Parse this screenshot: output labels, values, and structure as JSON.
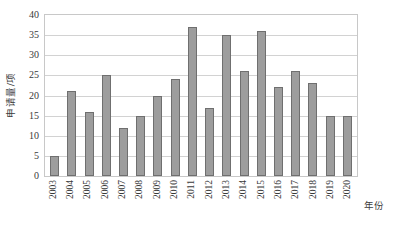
{
  "chart_data": {
    "type": "bar",
    "title": "",
    "subtitle": "",
    "xlabel": "年份",
    "ylabel": "申请量/项",
    "categories": [
      "2003",
      "2004",
      "2005",
      "2006",
      "2007",
      "2008",
      "2009",
      "2010",
      "2011",
      "2012",
      "2013",
      "2014",
      "2015",
      "2016",
      "2017",
      "2018",
      "2019",
      "2020"
    ],
    "values": [
      5,
      21,
      16,
      25,
      12,
      15,
      20,
      24,
      37,
      17,
      35,
      26,
      36,
      22,
      26,
      23,
      15,
      15
    ],
    "series": [
      {
        "name": "申请量",
        "values": [
          5,
          21,
          16,
          25,
          12,
          15,
          20,
          24,
          37,
          17,
          35,
          26,
          36,
          22,
          26,
          23,
          15,
          15
        ]
      }
    ],
    "ylim": [
      0,
      40
    ],
    "yticks": [
      "0",
      "5",
      "10",
      "15",
      "20",
      "25",
      "30",
      "35",
      "40"
    ],
    "ytick_values": [
      0,
      5,
      10,
      15,
      20,
      25,
      30,
      35,
      40
    ],
    "grid": "horizontal",
    "legend": "none",
    "annotations": [],
    "colors": {
      "bar_fill": "#9d9d9d",
      "bar_border": "#6f6f6f",
      "gridline": "#d2d2d2",
      "frame": "#c8c8c8",
      "text": "#3a3a3a",
      "background": "#ffffff"
    }
  }
}
